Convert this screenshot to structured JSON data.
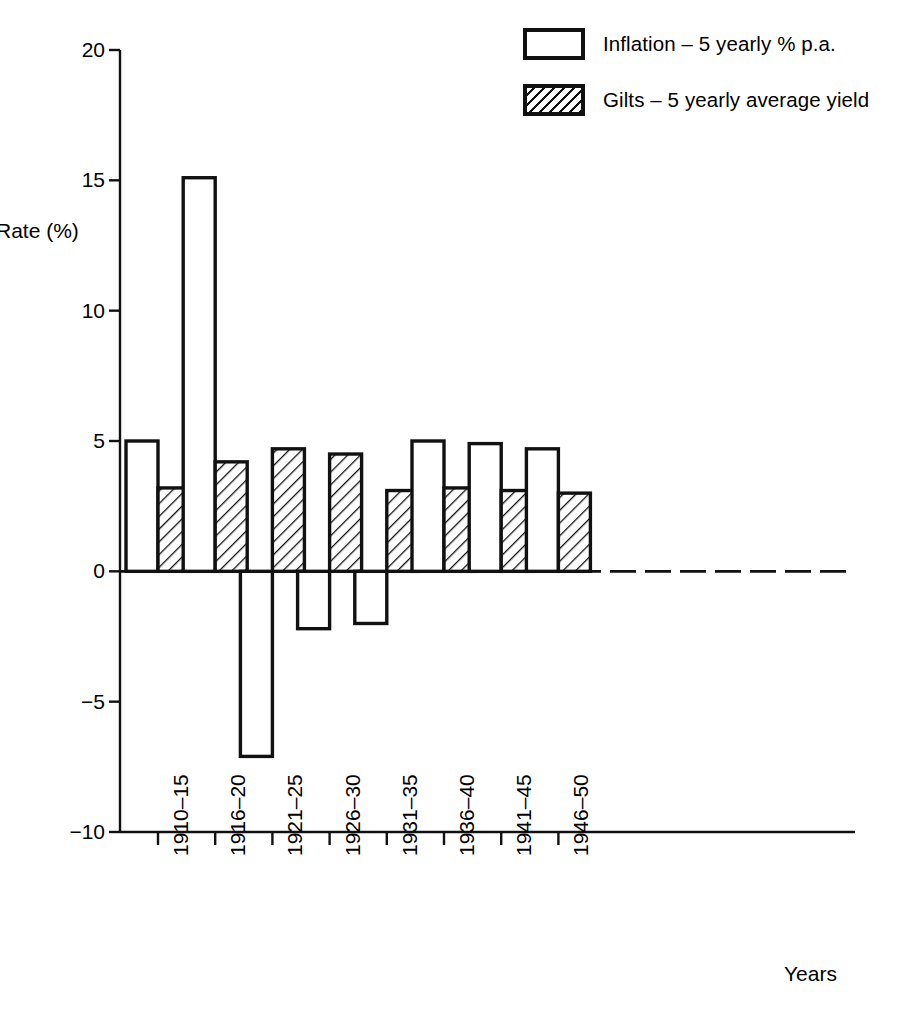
{
  "chart_data": {
    "type": "bar",
    "title": "",
    "xlabel": "Years",
    "ylabel": "Rate (%)",
    "ylim": [
      -10,
      20
    ],
    "yticks": [
      20,
      15,
      10,
      5,
      0,
      -5,
      -10
    ],
    "ytick_labels": [
      "20",
      "15",
      "10",
      "5",
      "0",
      "−5",
      "−10"
    ],
    "grid": false,
    "zero_line": "dashed",
    "legend_position": "top-right",
    "categories": [
      "1910–15",
      "1916–20",
      "1921–25",
      "1926–30",
      "1931–35",
      "1936–40",
      "1941–45",
      "1946–50"
    ],
    "series": [
      {
        "name": "Inflation – 5 yearly % p.a.",
        "fill": "white",
        "values": [
          5.0,
          15.1,
          -7.1,
          -2.2,
          -2.0,
          5.0,
          4.9,
          4.7
        ]
      },
      {
        "name": "Gilts – 5 yearly average yield",
        "fill": "hatched",
        "values": [
          3.2,
          4.2,
          4.7,
          4.5,
          3.1,
          3.2,
          3.1,
          3.0
        ]
      }
    ]
  },
  "legend": {
    "items": [
      {
        "label": "Inflation – 5 yearly % p.a.",
        "swatch": "empty-box-icon"
      },
      {
        "label": "Gilts – 5 yearly average yield",
        "swatch": "hatched-box-icon"
      }
    ]
  },
  "axes": {
    "y_title": "Rate (%)",
    "x_title": "Years"
  },
  "colors": {
    "ink": "#111111",
    "background": "#ffffff"
  }
}
